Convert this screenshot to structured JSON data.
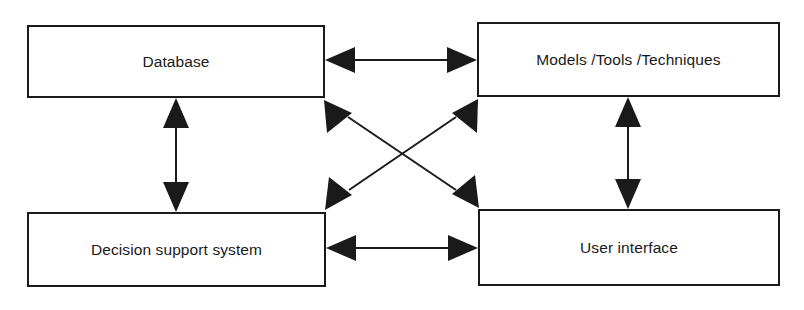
{
  "diagram": {
    "background_color": "#ffffff",
    "stroke_color": "#1a1a1a",
    "nodes": [
      {
        "id": "database",
        "label": "Database"
      },
      {
        "id": "models",
        "label": "Models /Tools /Techniques"
      },
      {
        "id": "dss",
        "label": "Decision support system"
      },
      {
        "id": "user_interface",
        "label": "User interface"
      }
    ],
    "edges": [
      {
        "id": "database-models",
        "from": "database",
        "to": "models",
        "orientation": "horizontal",
        "arrowheads": "both"
      },
      {
        "id": "dss-user-interface",
        "from": "dss",
        "to": "user_interface",
        "orientation": "horizontal",
        "arrowheads": "both"
      },
      {
        "id": "database-dss",
        "from": "database",
        "to": "dss",
        "orientation": "vertical",
        "arrowheads": "both"
      },
      {
        "id": "models-user-interface",
        "from": "models",
        "to": "user_interface",
        "orientation": "vertical",
        "arrowheads": "both"
      },
      {
        "id": "database-user-interface",
        "from": "database",
        "to": "user_interface",
        "orientation": "diagonal",
        "arrowheads": "both"
      },
      {
        "id": "models-dss",
        "from": "models",
        "to": "dss",
        "orientation": "diagonal",
        "arrowheads": "both"
      }
    ]
  }
}
